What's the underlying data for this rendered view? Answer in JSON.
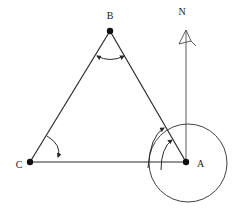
{
  "figure": {
    "name": "bearing-triangle-diagram",
    "type": "geometry-diagram",
    "width": 238,
    "height": 213,
    "background_color": "#ffffff",
    "line_color": "#2b2b2b",
    "label_color": "#1a1a1a"
  },
  "labels": {
    "north": "N",
    "vertex_a": "A",
    "vertex_b": "B",
    "vertex_c": "C"
  },
  "points": {
    "A": {
      "x": 186,
      "y": 162,
      "label": "A",
      "label_x": 197,
      "label_y": 167
    },
    "B": {
      "x": 110,
      "y": 31,
      "label": "B",
      "label_x": 110,
      "label_y": 19
    },
    "C": {
      "x": 30,
      "y": 162,
      "label": "C",
      "label_x": 19,
      "label_y": 168
    },
    "N": {
      "x": 186,
      "y": 30,
      "label": "N",
      "label_x": 182,
      "label_y": 14
    }
  },
  "segments": [
    {
      "name": "side-cb",
      "from": "C",
      "to": "B"
    },
    {
      "name": "side-ba",
      "from": "B",
      "to": "A"
    },
    {
      "name": "side-ca",
      "from": "C",
      "to": "A"
    },
    {
      "name": "north-line",
      "from": "A",
      "to": "N"
    }
  ],
  "circle": {
    "name": "bearing-circle",
    "center_x": 188,
    "center_y": 163,
    "radius": 39
  },
  "angle_arcs": [
    {
      "name": "angle-arc-b",
      "vertex": "B",
      "radius": 24,
      "double_headed": true
    },
    {
      "name": "angle-arc-c",
      "vertex": "C",
      "radius": 30,
      "double_headed": false
    },
    {
      "name": "angle-arc-a-outer",
      "vertex": "A",
      "radius": 38,
      "double_headed": false
    },
    {
      "name": "angle-arc-a-inner",
      "vertex": "A",
      "radius": 25,
      "double_headed": false
    }
  ],
  "north_marker": {
    "name": "north-arrow-flag",
    "description": "triangular flag arrowhead at top of north line"
  }
}
